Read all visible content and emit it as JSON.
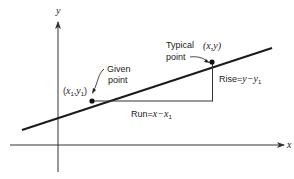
{
  "diagram": {
    "type": "slope-of-line",
    "axes": {
      "x_label": "x",
      "y_label": "y"
    },
    "points": {
      "given": {
        "coord_label": "(x1,y1)",
        "coord_base_x": "x",
        "coord_sub_x": "1",
        "coord_base_y": "y",
        "coord_sub_y": "1",
        "caption_line1": "Given",
        "caption_line2": "point"
      },
      "typical": {
        "coord_label": "(x,y)",
        "caption_line1": "Typical",
        "caption_line2": "point"
      }
    },
    "run": {
      "label": "Run=x−x1",
      "prefix": "Run=",
      "expr": "x−x",
      "sub": "1"
    },
    "rise": {
      "label": "Rise=y−y1",
      "prefix": "Rise=",
      "expr": "y−y",
      "sub": "1"
    },
    "colors": {
      "line": "#1a1a1a",
      "axis": "#333333",
      "text": "#222222"
    }
  }
}
